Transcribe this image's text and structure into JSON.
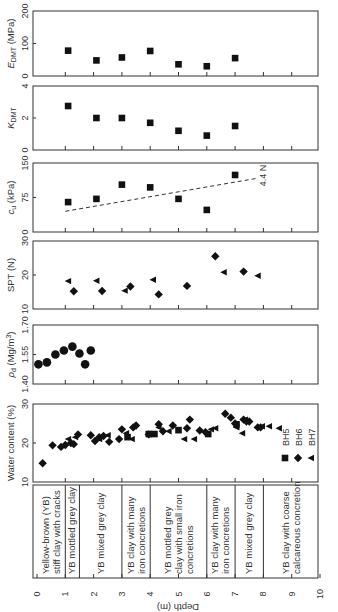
{
  "chart_data": {
    "type": "scatter",
    "orientation": "rotated-90 (depth axis horizontal, labels rotated)",
    "shared_axis": {
      "label": "Depth (m)",
      "range": [
        0,
        10
      ],
      "ticks": [
        "0",
        "1",
        "2",
        "3",
        "4",
        "5",
        "6",
        "7",
        "8",
        "9",
        "10"
      ]
    },
    "panels": [
      {
        "id": "edmt",
        "ylabel": "E_DMT (MPa)",
        "ylabel_main": "E",
        "ylabel_sub": "DMT",
        "ylabel_unit": " (MPa)",
        "ylim": [
          0,
          200
        ],
        "ticks": [
          "0",
          "100",
          "200"
        ],
        "series": [
          {
            "name": "DMT",
            "marker": "square",
            "x": [
              1.1,
              2.1,
              3.0,
              4.0,
              5.0,
              6.0,
              7.0
            ],
            "y": [
              78,
              48,
              57,
              77,
              36,
              30,
              55
            ]
          }
        ]
      },
      {
        "id": "kdmt",
        "ylabel": "K_DMT",
        "ylabel_main": "K",
        "ylabel_sub": "DMT",
        "ylabel_unit": "",
        "ylim": [
          0,
          4
        ],
        "ticks": [
          "0",
          "2",
          "4"
        ],
        "series": [
          {
            "name": "DMT",
            "marker": "square",
            "x": [
              1.1,
              2.1,
              3.0,
              4.0,
              5.0,
              6.0,
              7.0
            ],
            "y": [
              2.75,
              2.0,
              2.0,
              1.7,
              1.2,
              0.9,
              1.5
            ]
          }
        ]
      },
      {
        "id": "cu",
        "ylabel": "c_u (kPa)",
        "ylabel_main": "c",
        "ylabel_sub": "u",
        "ylabel_unit": " (kPa)",
        "ylim": [
          0,
          150
        ],
        "ticks": [
          "0",
          "75",
          "150"
        ],
        "series": [
          {
            "name": "cu",
            "marker": "square",
            "x": [
              1.1,
              2.1,
              3.0,
              4.0,
              5.0,
              6.0,
              7.0
            ],
            "y": [
              65,
              72,
              103,
              97,
              72,
              48,
              124
            ]
          }
        ],
        "trendline": {
          "label": "4.4 N",
          "style": "dashed",
          "x": [
            1.0,
            7.8
          ],
          "y": [
            45,
            117
          ]
        }
      },
      {
        "id": "spt",
        "ylabel": "SPT (N)",
        "ylabel_main": "SPT (N)",
        "ylabel_sub": "",
        "ylabel_unit": "",
        "ylim": [
          10,
          30
        ],
        "ticks": [
          "10",
          "20",
          "30"
        ],
        "series": [
          {
            "name": "BH6",
            "marker": "diamond",
            "x": [
              1.3,
              2.3,
              3.3,
              4.3,
              5.3,
              6.3,
              7.3
            ],
            "y": [
              15.2,
              15.3,
              16.6,
              14.3,
              16.8,
              25.5,
              21.0
            ]
          },
          {
            "name": "BH7",
            "marker": "triangle-left",
            "x": [
              1.1,
              2.1,
              3.1,
              4.1,
              6.6,
              7.8
            ],
            "y": [
              18.2,
              18.3,
              15.4,
              18.6,
              20.8,
              19.8
            ]
          }
        ]
      },
      {
        "id": "rhod",
        "ylabel": "ρd (Mg/m3)",
        "ylabel_main": "ρ",
        "ylabel_sub": "d",
        "ylabel_unit": " (Mg/m",
        "ylabel_sup": "3",
        "ylabel_close": ")",
        "ylim": [
          1.4,
          1.7
        ],
        "ticks": [
          "1.40",
          "1.55",
          "1.70"
        ],
        "series": [
          {
            "name": "BH5",
            "marker": "circle",
            "x": [
              0.05,
              0.35,
              0.65,
              0.95,
              1.25,
              1.5,
              1.7,
              1.9
            ],
            "y": [
              1.5,
              1.51,
              1.55,
              1.57,
              1.59,
              1.555,
              1.5,
              1.57
            ]
          }
        ]
      },
      {
        "id": "wc",
        "ylabel": "Water content (%)",
        "ylabel_main": "Water content (%)",
        "ylabel_sub": "",
        "ylabel_unit": "",
        "ylim": [
          10,
          30
        ],
        "ticks": [
          "10",
          "20",
          "30"
        ],
        "legend": [
          {
            "label": "BH5",
            "marker": "square"
          },
          {
            "label": "BH6",
            "marker": "diamond"
          },
          {
            "label": "BH7",
            "marker": "triangle-left"
          }
        ],
        "series": [
          {
            "name": "BH5",
            "marker": "square",
            "x": [
              3.2,
              3.95,
              4.15,
              5.0,
              6.05,
              7.05
            ],
            "y": [
              21.5,
              22.3,
              22.3,
              23.3,
              22.3,
              24.8
            ]
          },
          {
            "name": "BH6",
            "marker": "diamond",
            "x": [
              0.2,
              0.55,
              0.85,
              1.0,
              1.2,
              1.3,
              1.45,
              1.9,
              2.05,
              2.2,
              2.35,
              2.55,
              2.9,
              3.0,
              3.4,
              3.5,
              3.95,
              4.3,
              4.45,
              4.8,
              5.3,
              5.4,
              5.75,
              5.95,
              6.65,
              6.85,
              7.0,
              7.3,
              7.4,
              7.5,
              7.8,
              7.9
            ],
            "y": [
              14.8,
              19.4,
              19.0,
              19.5,
              20.0,
              19.7,
              22.2,
              22.0,
              20.5,
              21.5,
              21.8,
              20.3,
              21.0,
              23.5,
              24.0,
              24.5,
              22.2,
              24.8,
              23.0,
              24.5,
              23.8,
              26.0,
              23.2,
              22.8,
              27.5,
              26.5,
              25.0,
              26.0,
              25.5,
              25.5,
              24.0,
              24.0
            ]
          },
          {
            "name": "BH7",
            "marker": "triangle-left",
            "x": [
              1.1,
              1.35,
              2.2,
              2.5,
              3.15,
              3.35,
              4.3,
              4.65,
              5.2,
              5.55,
              6.15,
              6.3,
              7.05,
              7.25,
              7.35,
              7.95,
              8.2,
              8.55
            ],
            "y": [
              21.0,
              21.5,
              21.0,
              22.0,
              22.5,
              21.0,
              24.0,
              23.0,
              21.0,
              21.0,
              23.5,
              23.8,
              24.0,
              22.5,
              26.0,
              24.3,
              24.3,
              23.8
            ]
          }
        ]
      }
    ],
    "soil_profile": [
      {
        "from": 0.0,
        "to": 1.0,
        "lines": [
          "Yellow-brown (YB)",
          "stiff clay with cracks"
        ]
      },
      {
        "from": 1.0,
        "to": 1.5,
        "lines": [
          "YB mottled grey clay"
        ]
      },
      {
        "from": 1.5,
        "to": 3.0,
        "lines": [
          "YB mixed grey clay"
        ]
      },
      {
        "from": 3.0,
        "to": 4.0,
        "lines": [
          "YB clay with many",
          "iron concretions"
        ]
      },
      {
        "from": 4.0,
        "to": 6.0,
        "lines": [
          "YB mottled grey",
          "clay with small iron",
          "concretions"
        ]
      },
      {
        "from": 6.0,
        "to": 7.0,
        "lines": [
          "YB clay with many",
          "iron concretions"
        ]
      },
      {
        "from": 7.0,
        "to": 8.0,
        "lines": [
          "YB mixed grey clay"
        ]
      },
      {
        "from": 8.0,
        "to": 10.0,
        "lines": [
          "YB clay with coarse",
          "calcareous concretion"
        ]
      }
    ]
  }
}
